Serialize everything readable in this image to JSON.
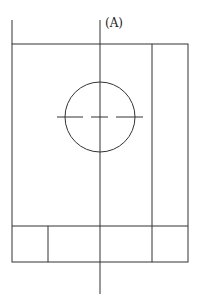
{
  "diagram": {
    "label": "(A)",
    "stroke_color": "#333333",
    "canvas": {
      "width": 200,
      "height": 302
    },
    "outer_box": {
      "x": 12,
      "y": 44,
      "width": 176,
      "height": 218
    },
    "left_extension": {
      "x": 12,
      "y1": 20,
      "y2": 44
    },
    "center_axis": {
      "x": 100,
      "y1": 20,
      "y2": 294
    },
    "right_column_divider": {
      "x": 152,
      "y1": 44,
      "y2": 262
    },
    "bottom_band": {
      "y": 226,
      "divider_x": 48
    },
    "circle": {
      "cx": 100,
      "cy": 117,
      "r": 35
    },
    "dashed_centerline": {
      "y": 117,
      "x1": 57,
      "x2": 143,
      "segments": [
        [
          57,
          83
        ],
        [
          91,
          108
        ],
        [
          116,
          143
        ]
      ]
    }
  }
}
